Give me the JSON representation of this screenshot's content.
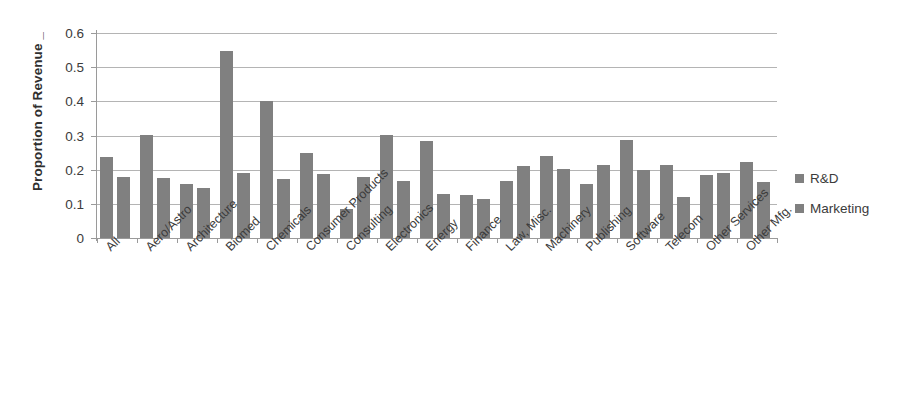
{
  "chart_data": {
    "type": "bar",
    "title": "",
    "xlabel": "",
    "ylabel": "Proportion of Revenue _",
    "ylim": [
      0,
      0.6
    ],
    "yticks": [
      "0",
      "0.1",
      "0.2",
      "0.3",
      "0.4",
      "0.5",
      "0.6"
    ],
    "ytick_values": [
      0,
      0.1,
      0.2,
      0.3,
      0.4,
      0.5,
      0.6
    ],
    "grid": true,
    "legend_position": "right",
    "categories": [
      "All",
      "Aero/Astro",
      "Architecture",
      "Biomed",
      "Chemicals",
      "Consumer Products",
      "Consulting",
      "Electronics",
      "Energy",
      "Finance",
      "Law, Misc.",
      "Machinery",
      "Publishing",
      "Software",
      "Telecom",
      "Other Services",
      "Other Mfg."
    ],
    "series": [
      {
        "name": "R&D",
        "color": "#808080",
        "values": [
          0.238,
          0.301,
          0.157,
          0.546,
          0.4,
          0.248,
          0.085,
          0.301,
          0.285,
          0.127,
          0.168,
          0.241,
          0.157,
          0.288,
          0.215,
          0.183,
          0.222
        ]
      },
      {
        "name": "Marketing",
        "color": "#808080",
        "values": [
          0.179,
          0.177,
          0.147,
          0.191,
          0.173,
          0.188,
          0.178,
          0.168,
          0.128,
          0.113,
          0.21,
          0.203,
          0.215,
          0.2,
          0.12,
          0.19,
          0.163
        ]
      }
    ]
  },
  "legend": {
    "items": [
      {
        "label": "R&D",
        "swatch": "legend-swatch-rd"
      },
      {
        "label": "Marketing",
        "swatch": "legend-swatch-marketing"
      }
    ]
  }
}
